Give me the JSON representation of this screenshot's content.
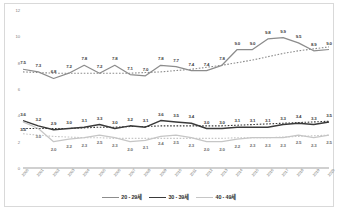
{
  "chart_data": {
    "type": "line",
    "title": "",
    "xlabel": "",
    "ylabel": "",
    "ylim": [
      0,
      12
    ],
    "yticks": [
      "0",
      "2",
      "4",
      "6",
      "8",
      "10",
      "12"
    ],
    "grid": false,
    "legend_position": "bottom",
    "categories": [
      "2000",
      "2001",
      "2002",
      "2003",
      "2004",
      "2005",
      "2006",
      "2007",
      "2008",
      "2009",
      "2010",
      "2011",
      "2012",
      "2013",
      "2014",
      "2015",
      "2016",
      "2017",
      "2018",
      "2019",
      "2020"
    ],
    "series": [
      {
        "name": "20 - 29세",
        "color": "#8c8c8c",
        "values": [
          7.5,
          7.3,
          6.8,
          7.2,
          7.8,
          7.2,
          7.8,
          7.1,
          7.0,
          7.8,
          7.7,
          7.4,
          7.4,
          7.8,
          9.0,
          9.0,
          9.8,
          9.9,
          9.5,
          8.9,
          9.0
        ],
        "trend": [
          7.3,
          7.25,
          7.2,
          7.2,
          7.2,
          7.2,
          7.2,
          7.2,
          7.25,
          7.3,
          7.4,
          7.5,
          7.65,
          7.8,
          8.0,
          8.2,
          8.45,
          8.7,
          8.9,
          9.05,
          9.2
        ]
      },
      {
        "name": "30 - 39세",
        "color": "#3a3a3a",
        "values": [
          3.6,
          3.2,
          2.9,
          3.0,
          3.1,
          3.3,
          3.0,
          3.2,
          3.1,
          3.6,
          3.5,
          3.4,
          3.0,
          3.0,
          3.1,
          3.1,
          3.1,
          3.3,
          3.4,
          3.3,
          3.5
        ],
        "trend": [
          3.0,
          3.0,
          3.0,
          3.0,
          3.05,
          3.1,
          3.1,
          3.15,
          3.15,
          3.2,
          3.2,
          3.2,
          3.2,
          3.2,
          3.25,
          3.3,
          3.35,
          3.4,
          3.45,
          3.5,
          3.55
        ]
      },
      {
        "name": "40 - 49세",
        "color": "#c6c6c6",
        "values": [
          3.5,
          3.0,
          2.0,
          2.2,
          2.3,
          2.5,
          2.3,
          2.0,
          2.1,
          2.4,
          2.5,
          2.3,
          2.0,
          2.0,
          2.2,
          2.3,
          2.3,
          2.3,
          2.5,
          2.3,
          2.5
        ],
        "trend": [
          2.6,
          2.5,
          2.4,
          2.35,
          2.3,
          2.3,
          2.25,
          2.25,
          2.25,
          2.25,
          2.25,
          2.25,
          2.25,
          2.25,
          2.3,
          2.3,
          2.3,
          2.35,
          2.4,
          2.45,
          2.5
        ]
      }
    ],
    "label_positions": {
      "series_0": "above",
      "series_1": "above",
      "series_2": "below"
    },
    "special_labels": [
      {
        "series": 1,
        "index": 0,
        "value": "3.5",
        "position": "below",
        "note": "40-49 first point label shown under 3.6"
      }
    ]
  }
}
